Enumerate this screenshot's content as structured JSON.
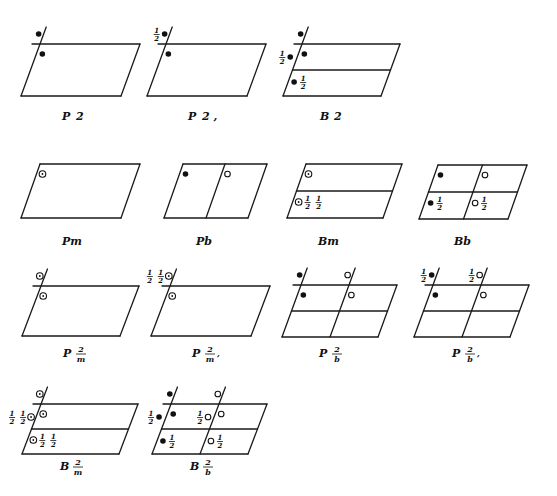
{
  "figure": {
    "cells": [
      {
        "id": "P2",
        "label_main": "P",
        "label_sym": "2",
        "label_suffix": "",
        "type": "single",
        "axis_ext": true,
        "symbols": [
          {
            "kind": "filled",
            "pos": "ext-top"
          },
          {
            "kind": "filled",
            "pos": "in-top"
          }
        ]
      },
      {
        "id": "P21",
        "label_main": "P",
        "label_sym": "2",
        "label_suffix": ",",
        "type": "single",
        "axis_ext": true,
        "symbols": [
          {
            "kind": "filled",
            "pos": "ext-top",
            "frac": "1/2",
            "frac_side": "left"
          },
          {
            "kind": "filled",
            "pos": "in-top"
          }
        ]
      },
      {
        "id": "B2",
        "label_main": "B",
        "label_sym": "2",
        "label_suffix": "",
        "type": "hsplit",
        "axis_ext": true,
        "symbols": [
          {
            "kind": "filled",
            "pos": "ext-top"
          },
          {
            "kind": "filled",
            "pos": "in-top"
          },
          {
            "kind": "filled",
            "pos": "ext-mid",
            "frac": "1/2",
            "frac_side": "left"
          },
          {
            "kind": "filled",
            "pos": "in-mid",
            "frac": "1/2",
            "frac_side": "right"
          }
        ]
      },
      {
        "id": "Pm",
        "label_main": "Pm",
        "type": "single",
        "axis_ext": false,
        "symbols": [
          {
            "kind": "dotted",
            "pos": "in-top"
          }
        ]
      },
      {
        "id": "Pb",
        "label_main": "Pb",
        "type": "vsplit",
        "axis_ext": false,
        "symbols": [
          {
            "kind": "filled",
            "pos": "in-top"
          },
          {
            "kind": "open",
            "pos": "in-top-right"
          }
        ]
      },
      {
        "id": "Bm",
        "label_main": "Bm",
        "type": "hsplit",
        "axis_ext": false,
        "symbols": [
          {
            "kind": "dotted",
            "pos": "in-top"
          },
          {
            "kind": "dotted",
            "pos": "in-mid",
            "frac": "1/2 1/2",
            "frac_side": "right"
          }
        ]
      },
      {
        "id": "Bb",
        "label_main": "Bb",
        "type": "quad",
        "axis_ext": false,
        "symbols": [
          {
            "kind": "filled",
            "pos": "in-top"
          },
          {
            "kind": "open",
            "pos": "in-top-right"
          },
          {
            "kind": "filled",
            "pos": "in-mid",
            "frac": "1/2",
            "frac_side": "right"
          },
          {
            "kind": "open",
            "pos": "in-mid-right",
            "frac": "1/2",
            "frac_side": "right"
          }
        ]
      },
      {
        "id": "P2/m",
        "label_main": "P",
        "label_num": "2",
        "label_den": "m",
        "label_suffix": "",
        "type": "single",
        "axis_ext": true,
        "symbols": [
          {
            "kind": "dotted",
            "pos": "ext-top"
          },
          {
            "kind": "dotted",
            "pos": "in-top"
          }
        ]
      },
      {
        "id": "P21/m",
        "label_main": "P",
        "label_num": "2",
        "label_den": "m",
        "label_suffix": ",",
        "type": "single",
        "axis_ext": true,
        "symbols": [
          {
            "kind": "dotted",
            "pos": "ext-top",
            "frac": "1/2 1/2",
            "frac_side": "left"
          },
          {
            "kind": "dotted",
            "pos": "in-top"
          }
        ]
      },
      {
        "id": "P2/b",
        "label_main": "P",
        "label_num": "2",
        "label_den": "b",
        "label_suffix": "",
        "type": "quad",
        "axis_ext": true,
        "axis_ext_right": true,
        "symbols": [
          {
            "kind": "filled",
            "pos": "ext-top"
          },
          {
            "kind": "filled",
            "pos": "in-top"
          },
          {
            "kind": "open",
            "pos": "ext-top-right"
          },
          {
            "kind": "open",
            "pos": "in-top-right"
          }
        ]
      },
      {
        "id": "P21/b",
        "label_main": "P",
        "label_num": "2",
        "label_den": "b",
        "label_suffix": ",",
        "type": "quad",
        "axis_ext": true,
        "axis_ext_right": true,
        "symbols": [
          {
            "kind": "filled",
            "pos": "ext-top",
            "frac": "1/2",
            "frac_side": "left"
          },
          {
            "kind": "filled",
            "pos": "in-top"
          },
          {
            "kind": "open",
            "pos": "ext-top-right",
            "frac": "1/2",
            "frac_side": "left"
          },
          {
            "kind": "open",
            "pos": "in-top-right"
          }
        ]
      },
      {
        "id": "B2/m",
        "label_main": "B",
        "label_num": "2",
        "label_den": "m",
        "label_suffix": "",
        "type": "hsplit",
        "axis_ext": true,
        "symbols": [
          {
            "kind": "dotted",
            "pos": "ext-top"
          },
          {
            "kind": "dotted",
            "pos": "in-top"
          },
          {
            "kind": "dotted",
            "pos": "ext-mid",
            "frac": "1/2 1/2",
            "frac_side": "left"
          },
          {
            "kind": "dotted",
            "pos": "in-mid",
            "frac": "1/2 1/2",
            "frac_side": "right"
          }
        ]
      },
      {
        "id": "B2/b",
        "label_main": "B",
        "label_num": "2",
        "label_den": "b",
        "label_suffix": "",
        "type": "quad",
        "axis_ext": true,
        "axis_ext_right": true,
        "symbols": [
          {
            "kind": "filled",
            "pos": "ext-top"
          },
          {
            "kind": "filled",
            "pos": "in-top"
          },
          {
            "kind": "open",
            "pos": "ext-top-right"
          },
          {
            "kind": "open",
            "pos": "in-top-right"
          },
          {
            "kind": "filled",
            "pos": "ext-mid",
            "frac": "1/2",
            "frac_side": "left"
          },
          {
            "kind": "filled",
            "pos": "in-mid",
            "frac": "1/2",
            "frac_side": "right"
          },
          {
            "kind": "open",
            "pos": "ext-mid-right",
            "frac": "1/2",
            "frac_side": "left"
          },
          {
            "kind": "open",
            "pos": "in-mid-right",
            "frac": "1/2",
            "frac_side": "right"
          }
        ]
      }
    ]
  }
}
